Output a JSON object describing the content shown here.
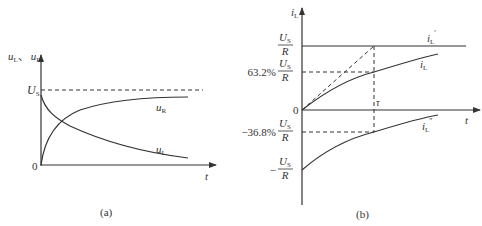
{
  "figure_a": {
    "caption": "(a)",
    "y_axis_label": "u_L、u_R",
    "y_axis_label_parts": {
      "u1": "u",
      "s1": "L",
      "sep": "、",
      "u2": "u",
      "s2": "R"
    },
    "x_axis_label": "t",
    "origin_label": "0",
    "us_label": {
      "main": "U",
      "sub": "S"
    },
    "curve_labels": {
      "uR": {
        "main": "u",
        "sub": "R"
      },
      "uL": {
        "main": "u",
        "sub": "L"
      }
    }
  },
  "figure_b": {
    "caption": "(b)",
    "y_axis_label": {
      "main": "i",
      "sub": "L"
    },
    "x_axis_label": "t",
    "origin_label": "0",
    "tau_label": "τ",
    "ticks": [
      {
        "prefix": "",
        "num_main": "U",
        "num_sub": "S",
        "den": "R"
      },
      {
        "prefix": "63.2%",
        "num_main": "U",
        "num_sub": "S",
        "den": "R"
      },
      {
        "prefix": "−36.8%",
        "num_main": "U",
        "num_sub": "S",
        "den": "R"
      },
      {
        "prefix": "−",
        "num_main": "U",
        "num_sub": "S",
        "den": "R"
      }
    ],
    "curve_labels": {
      "iL_prime": {
        "main": "i",
        "sub": "L",
        "sup": "′"
      },
      "iL": {
        "main": "i",
        "sub": "L"
      },
      "iL_double": {
        "main": "i",
        "sub": "L",
        "sup": "″"
      }
    }
  }
}
